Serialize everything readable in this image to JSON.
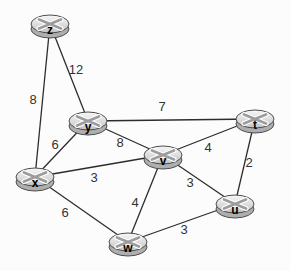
{
  "figure": {
    "background": "#fcfcfc",
    "edge_color": "#2d2d2d",
    "weight_color": "#333333",
    "node_style": {
      "top_fill_light": "#f7f7f7",
      "top_fill_dark": "#c3c3c3",
      "body_fill": "#aeaeae",
      "stroke": "#4d4d4d",
      "glyph_color": "#9c9c9c",
      "glyph_outline": "#ffffff",
      "label_color": "#000000"
    }
  },
  "chart_data": {
    "type": "graph",
    "nodes": [
      {
        "id": "z",
        "x": 50,
        "y": 24
      },
      {
        "id": "y",
        "x": 88,
        "y": 121
      },
      {
        "id": "t",
        "x": 255,
        "y": 119
      },
      {
        "id": "x",
        "x": 35,
        "y": 177
      },
      {
        "id": "v",
        "x": 163,
        "y": 155
      },
      {
        "id": "u",
        "x": 235,
        "y": 204
      },
      {
        "id": "w",
        "x": 128,
        "y": 242
      }
    ],
    "edges": [
      {
        "from": "z",
        "to": "y",
        "weight": 12,
        "lx": 76,
        "ly": 70
      },
      {
        "from": "z",
        "to": "x",
        "weight": 8,
        "lx": 33,
        "ly": 100
      },
      {
        "from": "y",
        "to": "t",
        "weight": 7,
        "lx": 162,
        "ly": 107
      },
      {
        "from": "y",
        "to": "v",
        "weight": 8,
        "lx": 120,
        "ly": 143
      },
      {
        "from": "y",
        "to": "x",
        "weight": 6,
        "lx": 55,
        "ly": 145
      },
      {
        "from": "x",
        "to": "v",
        "weight": 3,
        "lx": 94,
        "ly": 178
      },
      {
        "from": "x",
        "to": "w",
        "weight": 6,
        "lx": 65,
        "ly": 213
      },
      {
        "from": "v",
        "to": "t",
        "weight": 4,
        "lx": 208,
        "ly": 148
      },
      {
        "from": "v",
        "to": "u",
        "weight": 3,
        "lx": 190,
        "ly": 183
      },
      {
        "from": "v",
        "to": "w",
        "weight": 4,
        "lx": 135,
        "ly": 203
      },
      {
        "from": "t",
        "to": "u",
        "weight": 2,
        "lx": 249,
        "ly": 163
      },
      {
        "from": "w",
        "to": "u",
        "weight": 3,
        "lx": 184,
        "ly": 230
      }
    ]
  }
}
